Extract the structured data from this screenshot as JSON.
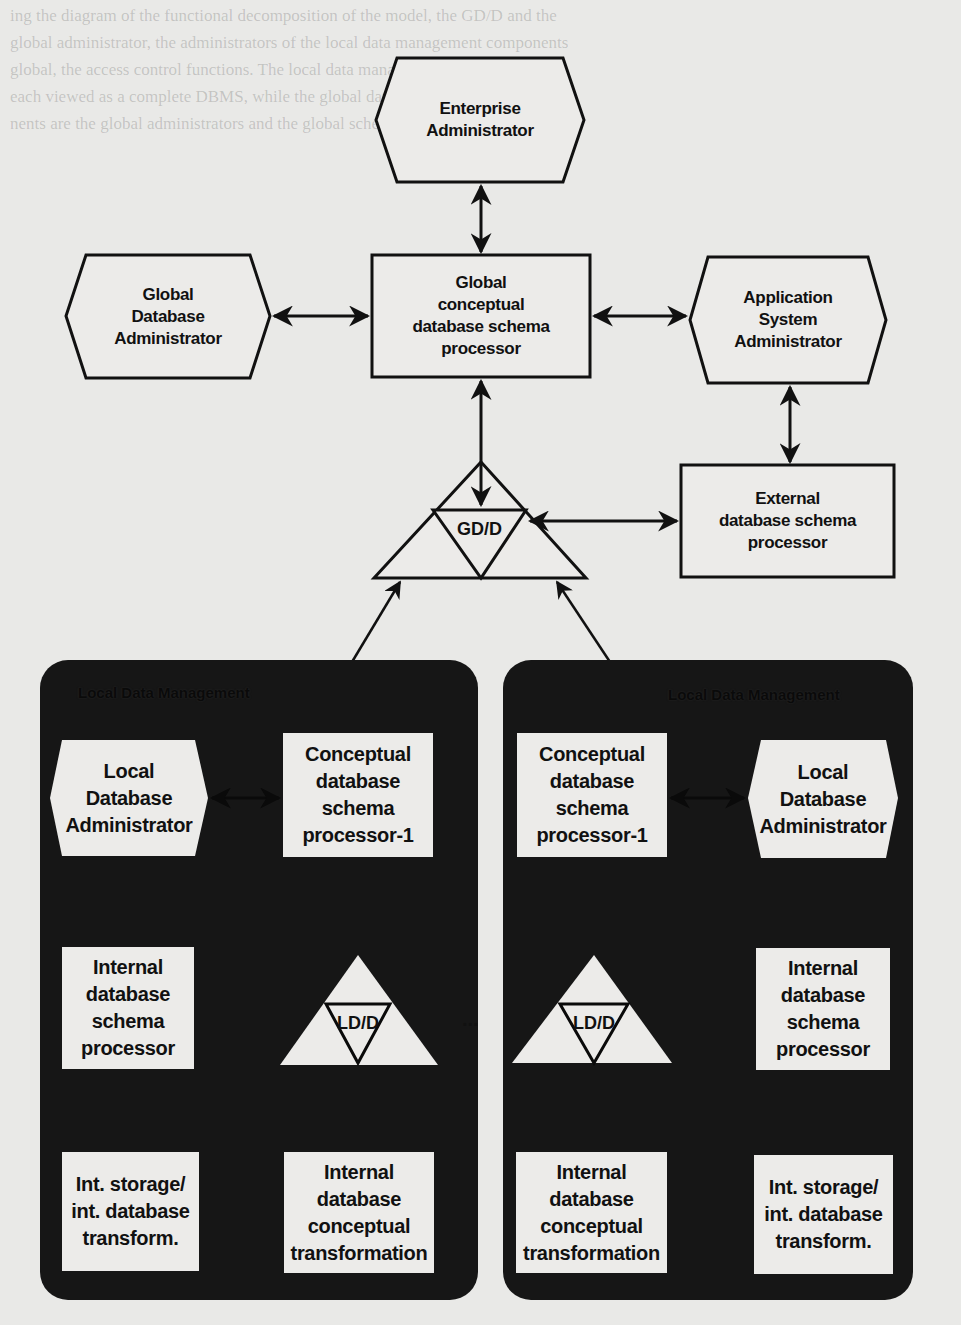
{
  "figure": {
    "background_text_lines": [
      "ing the diagram of the functional decomposition of the model, the GD/D and the",
      "global administrator, the administrators of the local data management components",
      "global, the access control functions. The local data management components are",
      "each viewed as a complete DBMS, while the global database management compo-",
      "nents are the global administrators and the global schema (Figure 1.4)."
    ],
    "global": {
      "enterprise_admin": "Enterprise\nAdministrator",
      "global_db_admin": "Global\nDatabase\nAdministrator",
      "global_conceptual_processor": "Global\nconceptual\ndatabase schema\nprocessor",
      "application_system_admin": "Application\nSystem\nAdministrator",
      "gdd_label": "GD/D",
      "external_processor": "External\ndatabase schema\nprocessor"
    },
    "local_panels": [
      {
        "header": "Local Data Management",
        "local_db_admin": "Local\nDatabase\nAdministrator",
        "conceptual_processor": "Conceptual\ndatabase\nschema\nprocessor-1",
        "internal_processor": "Internal\ndatabase\nschema\nprocessor",
        "ldd_label": "LD/D",
        "int_storage_transform": "Int. storage/\nint. database\ntransform.",
        "internal_conceptual_transform": "Internal\ndatabase\nconceptual\ntransformation"
      },
      {
        "header": "Local Data Management",
        "local_db_admin": "Local\nDatabase\nAdministrator",
        "conceptual_processor": "Conceptual\ndatabase\nschema\nprocessor-1",
        "internal_processor": "Internal\ndatabase\nschema\nprocessor",
        "ldd_label": "LD/D",
        "int_storage_transform": "Int. storage/\nint. database\ntransform.",
        "internal_conceptual_transform": "Internal\ndatabase\nconceptual\ntransformation"
      }
    ],
    "ellipsis": "...",
    "colors": {
      "paper": "#e9e9e7",
      "panel_dark": "#161616",
      "box_fill": "#ececea",
      "stroke": "#111111"
    }
  }
}
